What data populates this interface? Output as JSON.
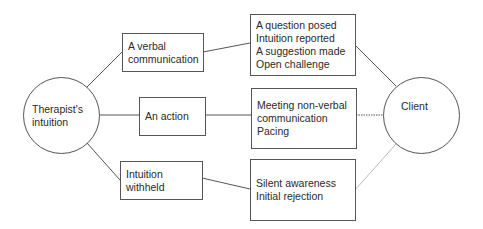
{
  "diagram": {
    "source": {
      "label_line1": "Therapist's",
      "label_line2": "intuition"
    },
    "target": {
      "label": "Client"
    },
    "categories": [
      {
        "label_line1": "A verbal",
        "label_line2": "communication"
      },
      {
        "label_line1": "An action",
        "label_line2": ""
      },
      {
        "label_line1": "Intuition",
        "label_line2": "withheld"
      }
    ],
    "outcomes": [
      {
        "items": [
          "A question posed",
          "Intuition reported",
          "A suggestion made",
          "Open challenge"
        ]
      },
      {
        "items": [
          "Meeting non-verbal",
          "communication",
          "Pacing"
        ]
      },
      {
        "items": [
          "Silent awareness",
          "Initial rejection"
        ]
      }
    ],
    "connections": [
      {
        "from": "Therapist's intuition",
        "to": "A verbal communication",
        "style": "solid"
      },
      {
        "from": "Therapist's intuition",
        "to": "An action",
        "style": "solid"
      },
      {
        "from": "Therapist's intuition",
        "to": "Intuition withheld",
        "style": "solid"
      },
      {
        "from": "A verbal communication",
        "to": "verbal outcomes",
        "style": "solid"
      },
      {
        "from": "An action",
        "to": "action outcomes",
        "style": "solid"
      },
      {
        "from": "Intuition withheld",
        "to": "withheld outcomes",
        "style": "solid"
      },
      {
        "from": "verbal outcomes",
        "to": "Client",
        "style": "solid"
      },
      {
        "from": "action outcomes",
        "to": "Client",
        "style": "dotted"
      },
      {
        "from": "withheld outcomes",
        "to": "Client",
        "style": "light"
      }
    ],
    "colors": {
      "stroke": "#555555",
      "light_stroke": "#bbbbbb",
      "text": "#2a2a2a"
    }
  }
}
